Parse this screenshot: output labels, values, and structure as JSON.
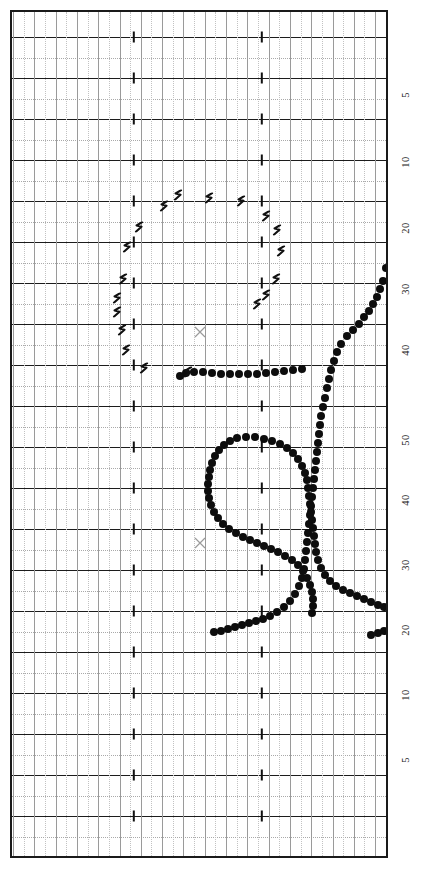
{
  "chart_data": {
    "type": "scatter",
    "title": "",
    "subtitle": "",
    "xlabel": "",
    "ylabel": "",
    "orientation": "rotated-90",
    "grid": {
      "major_horizontal_spacing_px": 41,
      "minor_horizontal_spacing_px": 20.5,
      "major_vertical_spacing_px": 21.3,
      "minor_vertical_spacing_px": 10.6,
      "major_line_color": "#1c1c1c",
      "minor_line_color": "#a9a9a9",
      "vertical_line_color": "#9a9a9a",
      "border_color": "#1a1a1a",
      "background_color": "#ffffff"
    },
    "axis_right": {
      "tick_labels": [
        "5",
        "10",
        "20",
        "30",
        "40",
        "50",
        "40",
        "30",
        "20",
        "10",
        "5"
      ],
      "tick_y_positions": [
        95,
        162,
        228,
        289,
        350,
        440,
        500,
        565,
        630,
        695,
        760
      ],
      "label_color": "#242424"
    },
    "tick_marks": {
      "x_positions": [
        134,
        262
      ],
      "color": "#111111"
    },
    "series": [
      {
        "name": "dot-trace",
        "marker": "filled-circle",
        "color": "#0d0d0d",
        "points": [
          [
            386,
            268
          ],
          [
            383,
            281
          ],
          [
            380,
            289
          ],
          [
            377,
            297
          ],
          [
            373,
            304
          ],
          [
            369,
            311
          ],
          [
            364,
            317
          ],
          [
            359,
            324
          ],
          [
            353,
            330
          ],
          [
            347,
            336
          ],
          [
            341,
            344
          ],
          [
            337,
            352
          ],
          [
            334,
            361
          ],
          [
            331,
            370
          ],
          [
            329,
            379
          ],
          [
            327,
            388
          ],
          [
            325,
            398
          ],
          [
            323,
            407
          ],
          [
            321,
            416
          ],
          [
            320,
            425
          ],
          [
            319,
            434
          ],
          [
            318,
            443
          ],
          [
            317,
            452
          ],
          [
            316,
            461
          ],
          [
            315,
            470
          ],
          [
            314,
            479
          ],
          [
            313,
            488
          ],
          [
            312,
            497
          ],
          [
            311,
            506
          ],
          [
            310,
            515
          ],
          [
            309,
            524
          ],
          [
            308,
            533
          ],
          [
            307,
            542
          ],
          [
            306,
            551
          ],
          [
            305,
            560
          ],
          [
            304,
            569
          ],
          [
            302,
            578
          ],
          [
            299,
            586
          ],
          [
            295,
            594
          ],
          [
            290,
            601
          ],
          [
            284,
            607
          ],
          [
            277,
            612
          ],
          [
            270,
            616
          ],
          [
            263,
            619
          ],
          [
            256,
            621
          ],
          [
            249,
            623
          ],
          [
            242,
            625
          ],
          [
            235,
            627
          ],
          [
            228,
            629
          ],
          [
            221,
            631
          ],
          [
            214,
            632
          ],
          [
            302,
            369
          ],
          [
            293,
            370
          ],
          [
            284,
            371
          ],
          [
            275,
            372
          ],
          [
            266,
            373
          ],
          [
            257,
            374
          ],
          [
            248,
            374
          ],
          [
            239,
            374
          ],
          [
            230,
            374
          ],
          [
            221,
            374
          ],
          [
            212,
            373
          ],
          [
            203,
            372
          ],
          [
            194,
            372
          ],
          [
            186,
            373
          ],
          [
            180,
            376
          ],
          [
            255,
            437
          ],
          [
            246,
            437
          ],
          [
            237,
            438
          ],
          [
            230,
            441
          ],
          [
            224,
            445
          ],
          [
            219,
            450
          ],
          [
            215,
            456
          ],
          [
            212,
            463
          ],
          [
            210,
            470
          ],
          [
            209,
            477
          ],
          [
            208,
            484
          ],
          [
            208,
            491
          ],
          [
            209,
            498
          ],
          [
            211,
            505
          ],
          [
            214,
            512
          ],
          [
            218,
            518
          ],
          [
            223,
            524
          ],
          [
            229,
            529
          ],
          [
            236,
            533
          ],
          [
            243,
            537
          ],
          [
            250,
            540
          ],
          [
            257,
            543
          ],
          [
            264,
            546
          ],
          [
            271,
            549
          ],
          [
            278,
            552
          ],
          [
            285,
            556
          ],
          [
            292,
            560
          ],
          [
            298,
            565
          ],
          [
            303,
            571
          ],
          [
            307,
            578
          ],
          [
            310,
            585
          ],
          [
            312,
            592
          ],
          [
            313,
            599
          ],
          [
            313,
            606
          ],
          [
            312,
            613
          ],
          [
            264,
            439
          ],
          [
            272,
            441
          ],
          [
            280,
            444
          ],
          [
            287,
            448
          ],
          [
            293,
            453
          ],
          [
            298,
            459
          ],
          [
            302,
            466
          ],
          [
            305,
            473
          ],
          [
            307,
            480
          ],
          [
            308,
            488
          ],
          [
            309,
            496
          ],
          [
            310,
            504
          ],
          [
            311,
            512
          ],
          [
            312,
            520
          ],
          [
            313,
            528
          ],
          [
            314,
            536
          ],
          [
            315,
            544
          ],
          [
            316,
            552
          ],
          [
            318,
            560
          ],
          [
            321,
            568
          ],
          [
            325,
            575
          ],
          [
            330,
            581
          ],
          [
            336,
            586
          ],
          [
            343,
            590
          ],
          [
            350,
            593
          ],
          [
            357,
            596
          ],
          [
            364,
            599
          ],
          [
            371,
            602
          ],
          [
            378,
            605
          ],
          [
            384,
            607
          ],
          [
            371,
            635
          ],
          [
            378,
            633
          ],
          [
            384,
            631
          ]
        ]
      },
      {
        "name": "hook-trace",
        "marker": "hook-glyph",
        "color": "#111111",
        "points": [
          [
            178,
            192
          ],
          [
            209,
            195
          ],
          [
            241,
            198
          ],
          [
            266,
            213
          ],
          [
            277,
            227
          ],
          [
            281,
            248
          ],
          [
            276,
            276
          ],
          [
            266,
            292
          ],
          [
            257,
            301
          ],
          [
            164,
            203
          ],
          [
            139,
            224
          ],
          [
            127,
            244
          ],
          [
            123,
            276
          ],
          [
            117,
            295
          ],
          [
            117,
            309
          ],
          [
            122,
            327
          ],
          [
            126,
            347
          ],
          [
            144,
            365
          ],
          [
            188,
            369
          ]
        ]
      },
      {
        "name": "x-markers",
        "marker": "cross",
        "color": "#9b9b9b",
        "points": [
          [
            200,
            331
          ],
          [
            200,
            542
          ]
        ]
      }
    ]
  }
}
